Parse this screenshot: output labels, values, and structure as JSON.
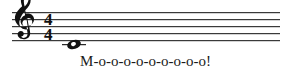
{
  "figure": {
    "kind": "music-notation-snippet",
    "background_color": "#ffffff",
    "ink_color": "#111111",
    "staff_line_color": "#3a3a3a"
  },
  "staff": {
    "line_count": 5,
    "clef": {
      "name": "treble-clef",
      "glyph": "𝄞",
      "label": "Treble clef (G clef)"
    },
    "time_signature": {
      "numerator": "4",
      "denominator": "4",
      "label": "4/4"
    },
    "notes": [
      {
        "name": "whole-note",
        "duration": "whole",
        "pitch": "C4",
        "pitch_label": "Middle C",
        "ledger_lines": 1,
        "ledger_position": "below staff"
      }
    ]
  },
  "lyric": {
    "text": "M-o-o-o-o-o-o-o-o-o!",
    "syllable_count": 10
  }
}
